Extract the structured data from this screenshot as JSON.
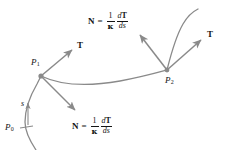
{
  "figure": {
    "background_color": "#ffffff",
    "stroke_color": "#8a8a8a",
    "text_color": "#141414",
    "width": 229,
    "height": 150
  },
  "labels": {
    "tangent_vector": "T",
    "normal_vector": "N",
    "equals": "=",
    "kappa": "κ",
    "one": "1",
    "dT": "dT",
    "ds": "ds",
    "point_start": "P",
    "point_start_sub": "0",
    "point_one": "P",
    "point_one_sub": "1",
    "point_two": "P",
    "point_two_sub": "2",
    "arc_length": "s"
  },
  "annotations": [
    {
      "name": "normal-formula-top",
      "text": "N = (1/κ) dT/ds",
      "x": 88,
      "y": 12
    },
    {
      "name": "normal-formula-bottom",
      "text": "N = (1/κ) dT/ds",
      "x": 72,
      "y": 117
    },
    {
      "name": "tangent-label-p1",
      "text": "T",
      "x": 77,
      "y": 46
    },
    {
      "name": "tangent-label-p2",
      "text": "T",
      "x": 207,
      "y": 35
    },
    {
      "name": "point-label-p0",
      "text": "P0",
      "x": 6,
      "y": 128
    },
    {
      "name": "point-label-p1",
      "text": "P1",
      "x": 32,
      "y": 63
    },
    {
      "name": "point-label-p2",
      "text": "P2",
      "x": 166,
      "y": 79
    },
    {
      "name": "arc-length-label",
      "text": "s",
      "x": 24,
      "y": 104
    }
  ],
  "geometry": {
    "curve_main": "Curve passes from P0 upward through P1, sweeps right and slightly down then up to P2, and continues up and left beyond P2",
    "point_p1": {
      "x": 41,
      "y": 76
    },
    "point_p2": {
      "x": 167,
      "y": 70
    },
    "point_p0": {
      "x": 27,
      "y": 131
    },
    "vectors": [
      {
        "name": "tangent-arrow-p1",
        "from": [
          41,
          76
        ],
        "to": [
          74,
          49
        ]
      },
      {
        "name": "normal-arrow-p1",
        "from": [
          41,
          76
        ],
        "to": [
          77,
          112
        ]
      },
      {
        "name": "tangent-arrow-p2",
        "from": [
          167,
          70
        ],
        "to": [
          203,
          38
        ]
      },
      {
        "name": "normal-arrow-p2",
        "from": [
          167,
          70
        ],
        "to": [
          139,
          33
        ]
      },
      {
        "name": "arc-direction-arrow",
        "from": [
          29,
          124
        ],
        "to": [
          29,
          104
        ]
      }
    ]
  }
}
